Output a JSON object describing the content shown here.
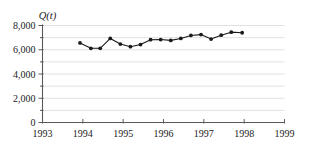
{
  "chart_data": {
    "type": "line",
    "title": "",
    "subtitle": "",
    "ylabel": "Q(t)",
    "xlabel": "",
    "xlim": [
      1993,
      1999
    ],
    "ylim": [
      0,
      8000
    ],
    "grid": true,
    "grid_interval": 1000,
    "legend": "none",
    "x_tick_labels": [
      "1993",
      "1994",
      "1995",
      "1996",
      "1997",
      "1998",
      "1999"
    ],
    "x_ticks": [
      1993,
      1994,
      1995,
      1996,
      1997,
      1998,
      1999
    ],
    "y_tick_labels": [
      "0",
      "2,000",
      "4,000",
      "6,000",
      "8,000"
    ],
    "y_ticks": [
      0,
      2000,
      4000,
      6000,
      8000
    ],
    "y_minor_ticks": [
      1000,
      3000,
      5000,
      7000
    ],
    "series": [
      {
        "name": "Q(t)",
        "marker": "filled-circle",
        "x": [
          1993.93,
          1994.2,
          1994.43,
          1994.68,
          1994.93,
          1995.18,
          1995.43,
          1995.68,
          1995.93,
          1996.18,
          1996.43,
          1996.68,
          1996.93,
          1997.18,
          1997.43,
          1997.68,
          1997.95
        ],
        "values": [
          6560,
          6120,
          6120,
          6930,
          6470,
          6250,
          6430,
          6830,
          6840,
          6770,
          6930,
          7180,
          7250,
          6880,
          7200,
          7450,
          7400
        ]
      }
    ]
  },
  "axis": {
    "y_title": "Q(t)"
  }
}
